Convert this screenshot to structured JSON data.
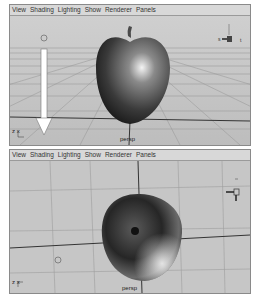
{
  "top_panel": {
    "menu": [
      "View",
      "Shading",
      "Lighting",
      "Show",
      "Renderer",
      "Panels"
    ],
    "camera_label": "persp",
    "axis_label": "z x",
    "arrow": "down"
  },
  "bottom_panel": {
    "menu": [
      "View",
      "Shading",
      "Lighting",
      "Show",
      "Renderer",
      "Panels"
    ],
    "camera_label": "persp",
    "axis_label": "z x"
  }
}
